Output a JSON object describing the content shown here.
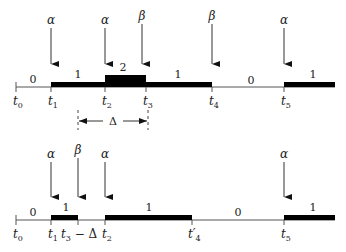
{
  "top": {
    "ticks": [
      {
        "x": 16,
        "label": "t",
        "sub": "0"
      },
      {
        "x": 51,
        "label": "t",
        "sub": "1"
      },
      {
        "x": 105,
        "label": "t",
        "sub": "2"
      },
      {
        "x": 146,
        "label": "t",
        "sub": "3"
      },
      {
        "x": 212,
        "label": "t",
        "sub": "4"
      },
      {
        "x": 284,
        "label": "t",
        "sub": "5"
      }
    ],
    "arrows": [
      {
        "x": 51,
        "label": "α"
      },
      {
        "x": 105,
        "label": "α"
      },
      {
        "x": 142,
        "label": "β"
      },
      {
        "x": 212,
        "label": "β"
      },
      {
        "x": 284,
        "label": "α"
      }
    ],
    "levels": [
      {
        "x": 33,
        "value": "0"
      },
      {
        "x": 78,
        "value": "1"
      },
      {
        "x": 123,
        "value": "2"
      },
      {
        "x": 178,
        "value": "1"
      },
      {
        "x": 251,
        "value": "0"
      },
      {
        "x": 313,
        "value": "1"
      }
    ],
    "delta_label": "Δ"
  },
  "bottom": {
    "ticks": [
      {
        "x": 16,
        "label": "t",
        "sub": "0"
      },
      {
        "x": 51,
        "label": "t",
        "sub": "1"
      },
      {
        "x": 78,
        "label": "t",
        "sub": "3",
        "suffix": " − Δ"
      },
      {
        "x": 105,
        "label": "t",
        "sub": "2"
      },
      {
        "x": 192,
        "label": "t′",
        "sub": "4"
      },
      {
        "x": 284,
        "label": "t",
        "sub": "5"
      }
    ],
    "arrows": [
      {
        "x": 51,
        "label": "α"
      },
      {
        "x": 78,
        "label": "β"
      },
      {
        "x": 105,
        "label": "α"
      },
      {
        "x": 284,
        "label": "α"
      }
    ],
    "levels": [
      {
        "x": 33,
        "value": "0"
      },
      {
        "x": 66,
        "value": "1"
      },
      {
        "x": 149,
        "value": "1"
      },
      {
        "x": 238,
        "value": "0"
      },
      {
        "x": 313,
        "value": "1"
      }
    ]
  }
}
